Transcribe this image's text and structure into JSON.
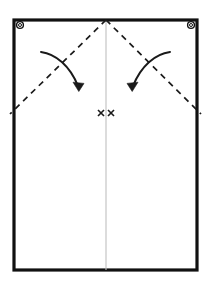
{
  "figure": {
    "title": "Folding diagram - rectangular sheet with corner eyelets",
    "canvas": {
      "width": 210,
      "height": 289,
      "background": "#ffffff"
    }
  },
  "colors": {
    "outline": "#111111",
    "fold_line": "#1a1a1a",
    "center_line": "#bfbfbf",
    "arrow": "#1a1a1a",
    "sheet_fill": "#ffffff",
    "eyelet_stroke": "#111111",
    "eyelet_fill": "#ffffff"
  },
  "sheet": {
    "name": "rectangular-sheet",
    "x": 14,
    "y": 20,
    "width": 183,
    "height": 250,
    "stroke_width": 3.2
  },
  "eyelets": [
    {
      "label": "top-left-eyelet",
      "cx": 20,
      "cy": 25,
      "r_outer": 3.4,
      "r_inner": 1.5
    },
    {
      "label": "top-right-eyelet",
      "cx": 191,
      "cy": 25,
      "r_outer": 3.4,
      "r_inner": 1.5
    }
  ],
  "center_line": {
    "label": "vertical-center-fold",
    "x": 106,
    "y1": 20,
    "y2": 270,
    "stroke_width": 1.1
  },
  "fold_lines": [
    {
      "label": "left-diagonal-fold",
      "x1": 106,
      "y1": 20,
      "x2": 10,
      "y2": 114,
      "dash": "6 5",
      "stroke_width": 1.7
    },
    {
      "label": "right-diagonal-fold",
      "x1": 106,
      "y1": 20,
      "x2": 201,
      "y2": 114,
      "dash": "6 5",
      "stroke_width": 1.7
    }
  ],
  "arrows": [
    {
      "label": "left-fold-arrow",
      "path": "M 41 52 C 56 54, 70 66, 78 86",
      "head": "M 78.8 91.5 L 73.0 82.2 L 84.0 83.4 Z",
      "stroke_width": 2.0
    },
    {
      "label": "right-fold-arrow",
      "path": "M 170 52 C 155 54, 141 66, 133 86",
      "head": "M 132.2 91.5 L 127.0 83.4 L 138.0 82.2 Z",
      "stroke_width": 2.0
    }
  ],
  "center_marks": {
    "label": "center-cross-marks",
    "glyph": "x",
    "items": [
      {
        "cx": 101,
        "cy": 113,
        "size": 6
      },
      {
        "cx": 111,
        "cy": 113,
        "size": 6
      }
    ],
    "stroke_width": 1.6
  },
  "labels": {
    "sheet": "Sheet outline",
    "center_line": "Center fold line",
    "fold_lines": "Diagonal fold lines",
    "arrows": "Fold direction arrows",
    "eyelets": "Corner eyelets",
    "center_marks": "Center alignment marks"
  }
}
